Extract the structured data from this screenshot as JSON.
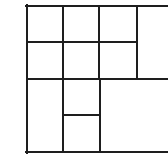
{
  "diagram": {
    "type": "grid-partition",
    "stroke_color": "#1e1e1e",
    "stroke_width": 2,
    "background": "#ffffff",
    "canvas": {
      "width": 168,
      "height": 160
    },
    "lines": [
      {
        "name": "top-border",
        "x1": 26,
        "y1": 6,
        "x2": 168,
        "y2": 6
      },
      {
        "name": "left-border",
        "x1": 27,
        "y1": 5,
        "x2": 27,
        "y2": 153
      },
      {
        "name": "bottom-border",
        "x1": 26,
        "y1": 152,
        "x2": 168,
        "y2": 152
      },
      {
        "name": "row1-divider",
        "x1": 27,
        "y1": 42,
        "x2": 137,
        "y2": 42
      },
      {
        "name": "row2-divider",
        "x1": 27,
        "y1": 79,
        "x2": 168,
        "y2": 79
      },
      {
        "name": "col1-divider",
        "x1": 63,
        "y1": 6,
        "x2": 63,
        "y2": 152
      },
      {
        "name": "col2-upper-divider",
        "x1": 99,
        "y1": 6,
        "x2": 99,
        "y2": 79
      },
      {
        "name": "col2-lower-divider",
        "x1": 100,
        "y1": 79,
        "x2": 100,
        "y2": 152
      },
      {
        "name": "col3-divider",
        "x1": 137,
        "y1": 6,
        "x2": 137,
        "y2": 79
      },
      {
        "name": "small-cell-divider",
        "x1": 63,
        "y1": 115,
        "x2": 100,
        "y2": 115
      }
    ],
    "cell_count": 11
  }
}
